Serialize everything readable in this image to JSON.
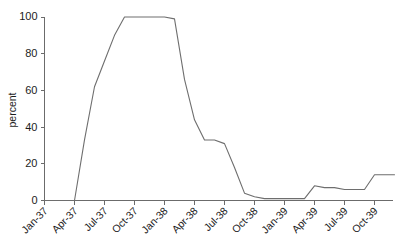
{
  "chart_data": {
    "type": "line",
    "title": "",
    "xlabel": "",
    "ylabel": "percent",
    "ylim": [
      0,
      100
    ],
    "yticks": [
      0,
      20,
      40,
      60,
      80,
      100
    ],
    "grid": false,
    "legend": "none",
    "line_color": "#6e6e6e",
    "axis_color": "#6b6b6b",
    "xtick_labels": [
      "Jan-37",
      "Apr-37",
      "Jul-37",
      "Oct-37",
      "Jan-38",
      "Apr-38",
      "Jul-38",
      "Oct-38",
      "Jan-39",
      "Apr-39",
      "Jul-39",
      "Oct-39"
    ],
    "xtick_rotation": -45,
    "x": [
      "Jan-37",
      "Feb-37",
      "Mar-37",
      "Apr-37",
      "May-37",
      "Jun-37",
      "Jul-37",
      "Aug-37",
      "Sep-37",
      "Oct-37",
      "Nov-37",
      "Dec-37",
      "Jan-38",
      "Feb-38",
      "Mar-38",
      "Apr-38",
      "May-38",
      "Jun-38",
      "Jul-38",
      "Aug-38",
      "Sep-38",
      "Oct-38",
      "Nov-38",
      "Dec-38",
      "Jan-39",
      "Feb-39",
      "Mar-39",
      "Apr-39",
      "May-39",
      "Jun-39",
      "Jul-39",
      "Aug-39",
      "Sep-39",
      "Oct-39",
      "Nov-39",
      "Dec-39"
    ],
    "values": [
      0,
      0,
      0,
      0,
      33,
      62,
      76,
      90,
      100,
      100,
      100,
      100,
      100,
      99,
      66,
      44,
      33,
      33,
      31,
      18,
      4,
      2,
      1,
      1,
      1,
      1,
      1,
      8,
      7,
      7,
      6,
      6,
      6,
      14,
      14,
      14
    ],
    "series_name": "percent"
  }
}
